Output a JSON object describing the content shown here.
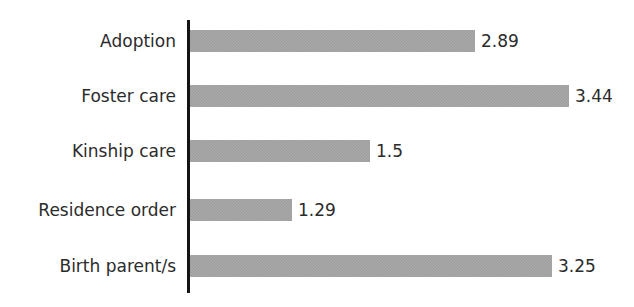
{
  "chart_data": {
    "type": "bar",
    "orientation": "horizontal",
    "title": "",
    "subtitle": "",
    "xlabel": "",
    "ylabel": "",
    "categories": [
      "Adoption",
      "Foster care",
      "Kinship care",
      "Residence order",
      "Birth parent/s"
    ],
    "values": [
      2.89,
      3.44,
      1.5,
      1.29,
      3.25
    ],
    "value_labels": [
      "2.89",
      "3.44",
      "1.5",
      "1.29",
      "3.25"
    ],
    "xlim": [
      0,
      3.6
    ],
    "grid": false,
    "legend": null,
    "legend_position": "none",
    "tick_labels": [],
    "annotations": [],
    "series": [
      {
        "name": "",
        "values": [
          2.89,
          3.44,
          1.5,
          1.29,
          3.25
        ]
      }
    ]
  },
  "style": {
    "bar_color": "#9b9b9b",
    "axis_color": "#141414",
    "text_color": "#2b2b2b",
    "background": "#ffffff"
  },
  "geometry": {
    "axis_x": 187,
    "axis_top": 20,
    "axis_bottom": 293,
    "bar_left": 190,
    "bar_height": 22,
    "rows": [
      {
        "top": 30,
        "width": 285,
        "label_top": 30,
        "value_left": 481
      },
      {
        "top": 85,
        "width": 379,
        "label_top": 85,
        "value_left": 575
      },
      {
        "top": 140,
        "width": 180,
        "label_top": 140,
        "value_left": 376
      },
      {
        "top": 199,
        "width": 102,
        "label_top": 199,
        "value_left": 298
      },
      {
        "top": 255,
        "width": 362,
        "label_top": 255,
        "value_left": 558
      }
    ]
  }
}
